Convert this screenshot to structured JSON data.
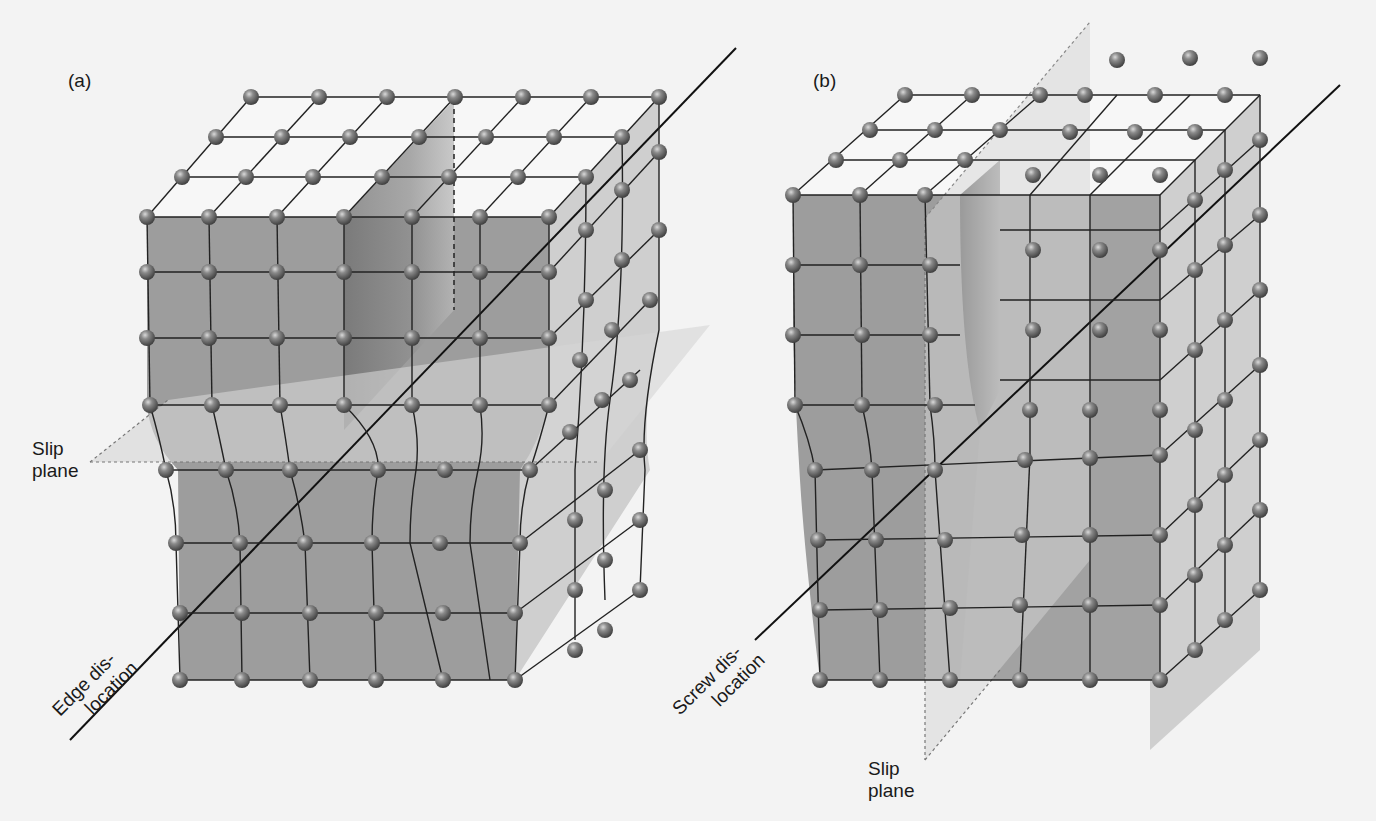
{
  "figure": {
    "panels": [
      {
        "id": "a",
        "label": "(a)",
        "type": "edge-dislocation",
        "slip_plane_label_line1": "Slip",
        "slip_plane_label_line2": "plane",
        "dislocation_label_line1": "Edge dis-",
        "dislocation_label_line2": "location"
      },
      {
        "id": "b",
        "label": "(b)",
        "type": "screw-dislocation",
        "slip_plane_label_line1": "Slip",
        "slip_plane_label_line2": "plane",
        "dislocation_label_line1": "Screw dis-",
        "dislocation_label_line2": "location"
      }
    ],
    "colors": {
      "background": "#f3f3f3",
      "front_face": "#9d9d9d",
      "side_face": "#cfcfcf",
      "slip_plane": "#d8d8d8",
      "atom": "#6e6e6e",
      "line": "#1e1e1e"
    }
  }
}
